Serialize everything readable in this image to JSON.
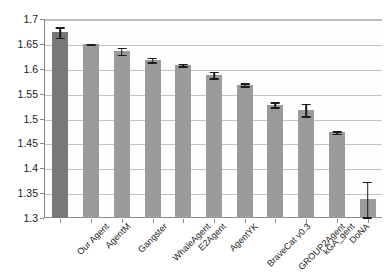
{
  "chart_data": {
    "type": "bar",
    "title": "",
    "subtitle": "",
    "xlabel": "",
    "ylabel": "",
    "ylim": [
      1.3,
      1.7
    ],
    "ytick_step": 0.05,
    "yticks": [
      "1.7",
      "1.65",
      "1.6",
      "1.55",
      "1.5",
      "1.45",
      "1.4",
      "1.35",
      "1.3"
    ],
    "grid": true,
    "legend": "none",
    "orientation": "vertical",
    "categories": [
      "Our Agent",
      "AgentM",
      "Gangster",
      "WhaleAgent",
      "E2Agent",
      "AgentYK",
      "BraveCat v0.3",
      "GROUP2Agent",
      "kGA_gent",
      "DoNA",
      "ANAC2014Agent"
    ],
    "values": [
      1.674,
      1.65,
      1.636,
      1.618,
      1.608,
      1.588,
      1.568,
      1.528,
      1.518,
      1.472,
      1.338
    ],
    "error_low": [
      1.661,
      1.647,
      1.627,
      1.612,
      1.604,
      1.58,
      1.564,
      1.521,
      1.503,
      1.468,
      1.3
    ],
    "error_high": [
      1.686,
      1.652,
      1.644,
      1.624,
      1.612,
      1.596,
      1.573,
      1.535,
      1.532,
      1.476,
      1.375
    ],
    "bar_colors": [
      "#787878",
      "#9b9b9b",
      "#9b9b9b",
      "#9b9b9b",
      "#9b9b9b",
      "#9b9b9b",
      "#9b9b9b",
      "#9b9b9b",
      "#9b9b9b",
      "#9b9b9b",
      "#9b9b9b"
    ],
    "error_color": "#1c1c1c",
    "gridline_color": "#c2c2c2",
    "axis_color": "#8a8a8a"
  }
}
